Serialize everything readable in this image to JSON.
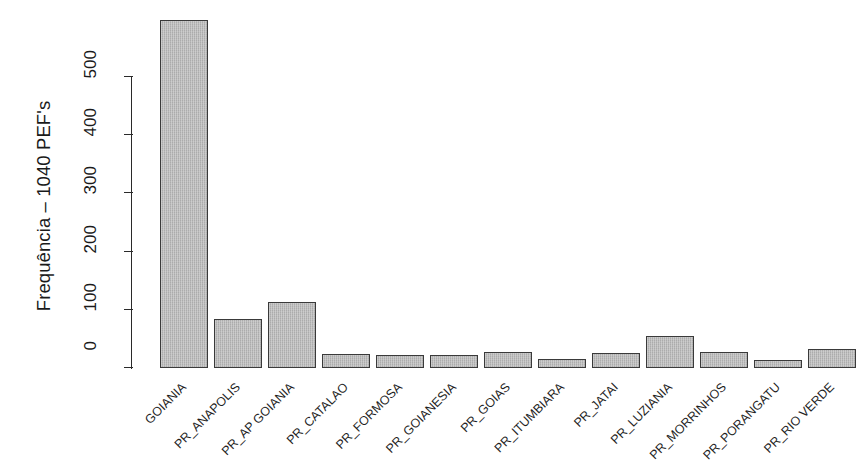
{
  "chart_data": {
    "type": "bar",
    "title": "",
    "subtitle": "",
    "xlabel": "",
    "ylabel": "Frequência – 1040 PEF's",
    "ylim": [
      0,
      600
    ],
    "yticks": [
      0,
      100,
      200,
      300,
      400,
      500
    ],
    "grid": false,
    "legend": null,
    "bar_color": "#b4b4b4",
    "bar_border_color": "#3a3a3a",
    "axis_color": "#2a2a2a",
    "categories": [
      "GOIANIA",
      "PR_ANAPOLIS",
      "PR_AP GOIANIA",
      "PR_CATALAO",
      "PR_FORMOSA",
      "PR_GOIANESIA",
      "PR_GOIAS",
      "PR_ITUMBIARA",
      "PR_JATAI",
      "PR_LUZIANIA",
      "PR_MORRINHOS",
      "PR_PORANGATU",
      "PR_RIO VERDE"
    ],
    "values": [
      598,
      85,
      113,
      24,
      22,
      23,
      27,
      15,
      25,
      55,
      28,
      13,
      33
    ]
  }
}
